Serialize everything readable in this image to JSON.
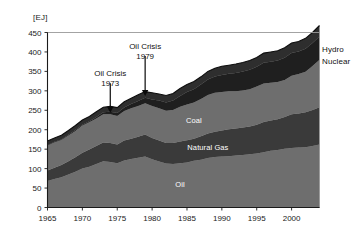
{
  "chart_data": {
    "type": "area",
    "title": "",
    "xlabel": "",
    "ylabel": "[EJ]",
    "unit_label": "[EJ]",
    "xlim": [
      1965,
      2004
    ],
    "ylim": [
      0,
      450
    ],
    "ytick_step": 50,
    "grid": false,
    "stacked": true,
    "legend_position": "inline-labels",
    "ytick_labels": [
      "0",
      "50",
      "100",
      "150",
      "200",
      "250",
      "300",
      "350",
      "400",
      "450"
    ],
    "ytick_values": [
      0,
      50,
      100,
      150,
      200,
      250,
      300,
      350,
      400,
      450
    ],
    "xtick_labels": [
      "1965",
      "1970",
      "1975",
      "1980",
      "1985",
      "1990",
      "1995",
      "2000"
    ],
    "xtick_values": [
      1965,
      1970,
      1975,
      1980,
      1985,
      1990,
      1995,
      2000
    ],
    "x": [
      1965,
      1966,
      1967,
      1968,
      1969,
      1970,
      1971,
      1972,
      1973,
      1974,
      1975,
      1976,
      1977,
      1978,
      1979,
      1980,
      1981,
      1982,
      1983,
      1984,
      1985,
      1986,
      1987,
      1988,
      1989,
      1990,
      1991,
      1992,
      1993,
      1994,
      1995,
      1996,
      1997,
      1998,
      1999,
      2000,
      2001,
      2002,
      2003,
      2004
    ],
    "series": [
      {
        "name": "Oil",
        "color": "#6e6e6e",
        "label_x": 1984,
        "label_y": 60,
        "values": [
          68,
          73,
          78,
          85,
          92,
          100,
          105,
          112,
          119,
          117,
          114,
          121,
          125,
          128,
          131,
          124,
          118,
          113,
          112,
          114,
          116,
          120,
          123,
          127,
          130,
          131,
          132,
          134,
          135,
          137,
          139,
          142,
          146,
          148,
          151,
          153,
          154,
          155,
          158,
          162
        ]
      },
      {
        "name": "Natural Gas",
        "color": "#3a3a3a",
        "label_x": 1988,
        "label_y": 155,
        "values": [
          27,
          29,
          31,
          34,
          37,
          41,
          44,
          46,
          48,
          49,
          48,
          51,
          52,
          54,
          57,
          55,
          54,
          53,
          54,
          56,
          57,
          57,
          60,
          63,
          65,
          67,
          69,
          69,
          71,
          71,
          74,
          78,
          78,
          79,
          82,
          87,
          88,
          90,
          93,
          96
        ]
      },
      {
        "name": "Coal",
        "color": "#6e6e6e",
        "label_x": 1986,
        "label_y": 225,
        "values": [
          65,
          66,
          65,
          66,
          68,
          70,
          70,
          71,
          73,
          74,
          73,
          76,
          78,
          79,
          80,
          82,
          83,
          83,
          85,
          89,
          92,
          93,
          96,
          99,
          100,
          99,
          98,
          96,
          95,
          96,
          98,
          99,
          97,
          96,
          95,
          99,
          101,
          104,
          113,
          122
        ]
      },
      {
        "name": "Nuclear",
        "color": "#1f1f1f",
        "label_x": 0,
        "label_y": 0,
        "values": [
          1,
          1,
          1,
          2,
          2,
          2,
          3,
          4,
          5,
          6,
          8,
          9,
          11,
          13,
          14,
          17,
          20,
          21,
          24,
          28,
          32,
          34,
          37,
          40,
          42,
          44,
          45,
          47,
          49,
          50,
          51,
          53,
          54,
          55,
          57,
          58,
          58,
          59,
          59,
          60
        ]
      },
      {
        "name": "Hydro",
        "color": "#2e2e2e",
        "label_x": 0,
        "label_y": 0,
        "values": [
          10,
          10,
          11,
          11,
          12,
          12,
          12,
          13,
          13,
          14,
          14,
          15,
          15,
          16,
          16,
          17,
          17,
          18,
          18,
          19,
          19,
          20,
          20,
          21,
          21,
          22,
          22,
          23,
          23,
          24,
          24,
          25,
          25,
          25,
          26,
          26,
          26,
          27,
          27,
          28
        ]
      }
    ],
    "side_labels": [
      {
        "name": "Hydro",
        "text": "Hydro"
      },
      {
        "name": "Nuclear",
        "text": "Nuclear"
      }
    ],
    "annotations": [
      {
        "name": "oil-crisis-1973",
        "line1": "Oil Crisis",
        "line2": "1973",
        "x": 1974,
        "text_y": 330,
        "arrow_to_y": 245
      },
      {
        "name": "oil-crisis-1979",
        "line1": "Oil Crisis",
        "line2": "1979",
        "x": 1979,
        "text_y": 400,
        "arrow_to_y": 288
      }
    ]
  }
}
